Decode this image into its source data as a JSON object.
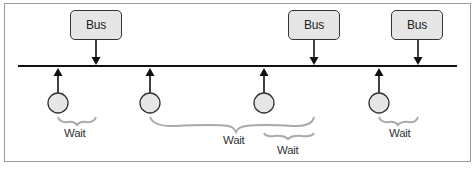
{
  "diagram": {
    "type": "bus-timeline",
    "colors": {
      "line": "#111111",
      "box_fill": "#e6e6e6",
      "node_fill": "#e6e6e6",
      "brace": "#aaaaaa",
      "frame": "#9a9a9a"
    },
    "buses": [
      {
        "label": "Bus",
        "x": 70
      },
      {
        "label": "Bus",
        "x": 288
      },
      {
        "label": "Bus",
        "x": 391
      }
    ],
    "waits": [
      {
        "label": "Wait"
      },
      {
        "label": "Wait"
      },
      {
        "label": "Wait"
      },
      {
        "label": "Wait"
      }
    ]
  }
}
